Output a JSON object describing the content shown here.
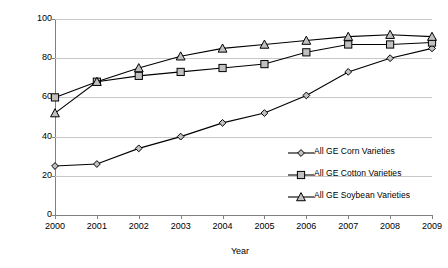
{
  "chart_data": {
    "type": "line",
    "title": "",
    "xlabel": "Year",
    "ylabel": "Percent of corn, cotton, and soybean acres",
    "categories": [
      "2000",
      "2001",
      "2002",
      "2003",
      "2004",
      "2005",
      "2006",
      "2007",
      "2008",
      "2009"
    ],
    "x": [
      2000,
      2001,
      2002,
      2003,
      2004,
      2005,
      2006,
      2007,
      2008,
      2009
    ],
    "xlim": [
      2000,
      2009
    ],
    "ylim": [
      0,
      100
    ],
    "yticks": [
      0,
      20,
      40,
      60,
      80,
      100
    ],
    "grid": true,
    "legend_position": "inside-right",
    "series": [
      {
        "name": "All GE Corn Varieties",
        "marker": "diamond",
        "color": "#000000",
        "values": [
          25,
          26,
          34,
          40,
          47,
          52,
          61,
          73,
          80,
          85
        ]
      },
      {
        "name": "All GE Cotton Varieties",
        "marker": "square",
        "color": "#000000",
        "values": [
          60,
          68,
          71,
          73,
          75,
          77,
          83,
          87,
          87,
          88
        ]
      },
      {
        "name": "All GE Soybean Varieties",
        "marker": "triangle",
        "color": "#000000",
        "values": [
          52,
          68,
          75,
          81,
          85,
          87,
          89,
          91,
          92,
          91
        ]
      }
    ]
  },
  "axes": {
    "y_tick_labels": [
      "0",
      "20",
      "40",
      "60",
      "80",
      "100"
    ],
    "x_tick_labels": [
      "2000",
      "2001",
      "2002",
      "2003",
      "2004",
      "2005",
      "2006",
      "2007",
      "2008",
      "2009"
    ],
    "y_axis_title": "Percent of corn, cotton, and soybean acres",
    "x_axis_title": "Year"
  },
  "legend": {
    "items": [
      {
        "label": "All GE Corn Varieties",
        "marker": "diamond"
      },
      {
        "label": "All GE Cotton Varieties",
        "marker": "square"
      },
      {
        "label": "All GE Soybean Varieties",
        "marker": "triangle"
      }
    ]
  },
  "colors": {
    "line": "#000000",
    "marker_fill": "#c0c0c0",
    "marker_stroke": "#000000",
    "grid": "#c8c8c8",
    "axis": "#808080",
    "background": "#ffffff"
  }
}
